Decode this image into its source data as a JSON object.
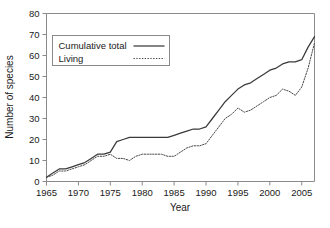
{
  "chart_data": {
    "type": "line",
    "title": "",
    "xlabel": "Year",
    "ylabel": "Number of species",
    "xlim": [
      1965,
      2007
    ],
    "ylim": [
      0,
      80
    ],
    "ytick_values": [
      0,
      10,
      20,
      30,
      40,
      50,
      60,
      70,
      80
    ],
    "ytick_labels": [
      "0",
      "10",
      "20",
      "30",
      "40",
      "50",
      "60",
      "70",
      "80"
    ],
    "xtick_values": [
      1965,
      1970,
      1975,
      1980,
      1985,
      1990,
      1995,
      2000,
      2005
    ],
    "xtick_labels": [
      "1965",
      "1970",
      "1975",
      "1980",
      "1985",
      "1990",
      "1995",
      "2000",
      "2005"
    ],
    "grid": false,
    "legend_position": "upper-left-inside",
    "x": [
      1965,
      1966,
      1967,
      1968,
      1969,
      1970,
      1971,
      1972,
      1973,
      1974,
      1975,
      1976,
      1977,
      1978,
      1979,
      1980,
      1981,
      1982,
      1983,
      1984,
      1985,
      1986,
      1987,
      1988,
      1989,
      1990,
      1991,
      1992,
      1993,
      1994,
      1995,
      1996,
      1997,
      1998,
      1999,
      2000,
      2001,
      2002,
      2003,
      2004,
      2005,
      2006,
      2007
    ],
    "series": [
      {
        "name": "Cumulative total",
        "style": "solid",
        "color": "#3a3a3a",
        "values": [
          2,
          4,
          6,
          6,
          7,
          8,
          9,
          11,
          13,
          13,
          14,
          19,
          20,
          21,
          21,
          21,
          21,
          21,
          21,
          21,
          22,
          23,
          24,
          25,
          25,
          26,
          30,
          34,
          38,
          41,
          44,
          46,
          47,
          49,
          51,
          53,
          54,
          56,
          57,
          57,
          58,
          64,
          69
        ]
      },
      {
        "name": "Living",
        "style": "dotted",
        "color": "#4a4a4a",
        "values": [
          2,
          3,
          5,
          5,
          6,
          7,
          8,
          10,
          12,
          12,
          13,
          11,
          11,
          10,
          12,
          13,
          13,
          13,
          13,
          12,
          12,
          14,
          16,
          17,
          17,
          18,
          22,
          26,
          30,
          32,
          35,
          33,
          34,
          36,
          38,
          40,
          41,
          44,
          43,
          41,
          45,
          54,
          66
        ]
      }
    ]
  },
  "legend": {
    "entries": [
      {
        "label": "Cumulative total",
        "style": "solid"
      },
      {
        "label": "Living",
        "style": "dotted"
      }
    ]
  }
}
